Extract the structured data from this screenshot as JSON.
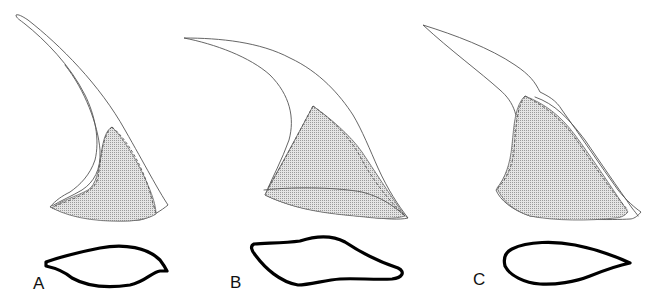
{
  "figure": {
    "type": "scientific-illustration",
    "colors": {
      "background": "#ffffff",
      "outline": "#555555",
      "stipple": "#9a9a9a",
      "section_stroke": "#000000"
    },
    "panels": [
      {
        "id": "A",
        "label": "A",
        "view": "lateral outline, slender curved spine with stippled base",
        "section": "lanceolate cross-section, pointed right end"
      },
      {
        "id": "B",
        "label": "B",
        "view": "lateral outline, broad-based hooked spine with stippled triangular base",
        "section": "rhomboid cross-section"
      },
      {
        "id": "C",
        "label": "C",
        "view": "lateral outline, sigmoid spine with broad stippled base",
        "section": "teardrop cross-section, pointed right end"
      }
    ]
  }
}
